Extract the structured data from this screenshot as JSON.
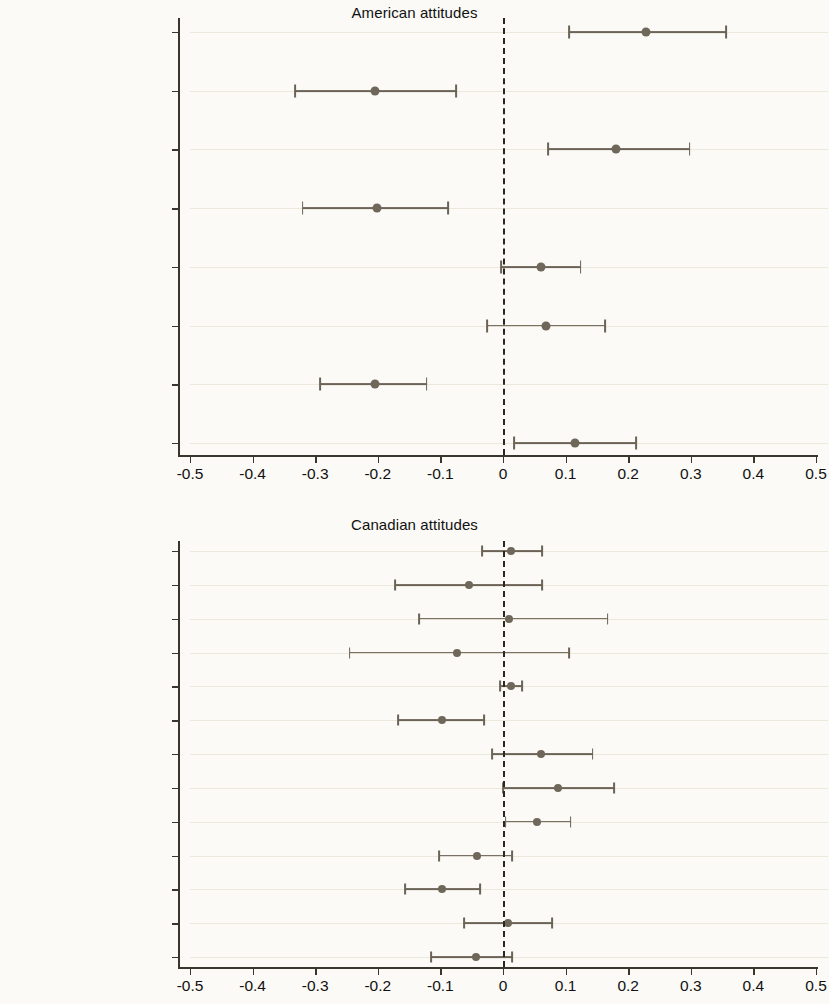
{
  "figure": {
    "axis_min": -0.5,
    "axis_max": 0.5,
    "tick_labels": [
      "-0.5",
      "-0.4",
      "-0.3",
      "-0.2",
      "-0.1",
      "0",
      "0.1",
      "0.2",
      "0.3",
      "0.4",
      "0.5"
    ],
    "tick_values": [
      -0.5,
      -0.4,
      -0.3,
      -0.2,
      -0.1,
      0,
      0.1,
      0.2,
      0.3,
      0.4,
      0.5
    ],
    "reference_value": 0,
    "point_color": "#6f6759",
    "line_color": "#6b6355",
    "grid_color": "#ece8dc",
    "background": "#fbfaf6"
  },
  "chart_data": [
    {
      "type": "scatter",
      "title": "American attitudes",
      "xlabel": "",
      "ylabel": "",
      "xlim": [
        -0.5,
        0.5
      ],
      "grid": true,
      "legend": "none",
      "reference_line": 0,
      "categories": [
        "Republican vote choice",
        "Democrat vote choice",
        "Republican ID",
        "Democrat ID",
        "Left right placement",
        "Clinton therm",
        "Obama therm",
        "Trump therm"
      ],
      "estimates": [
        0.228,
        -0.205,
        0.18,
        -0.202,
        0.06,
        0.068,
        -0.205,
        0.115
      ],
      "ci_low": [
        0.105,
        -0.332,
        0.072,
        -0.32,
        -0.003,
        -0.025,
        -0.292,
        0.018
      ],
      "ci_high": [
        0.357,
        -0.075,
        0.298,
        -0.088,
        0.124,
        0.163,
        -0.122,
        0.212
      ]
    },
    {
      "type": "scatter",
      "title": "Canadian attitudes",
      "xlabel": "",
      "ylabel": "",
      "xlim": [
        -0.5,
        0.5
      ],
      "grid": true,
      "legend": "none",
      "reference_line": 0,
      "categories": [
        "PPC vote choice",
        "NDP vote choice",
        "Conservative vote choice",
        "Liberal vote choice",
        "PPC ID",
        "NDP ID",
        "Conservative ID",
        "Liberal ID",
        "Left right placement",
        "Bernier therm",
        "Singh therm",
        "Scheer therm",
        "Trudeau therm"
      ],
      "estimates": [
        0.012,
        -0.055,
        0.01,
        -0.074,
        0.012,
        -0.098,
        0.06,
        0.088,
        0.055,
        -0.042,
        -0.097,
        0.008,
        -0.043
      ],
      "ci_low": [
        -0.034,
        -0.172,
        -0.134,
        -0.245,
        -0.004,
        -0.168,
        -0.018,
        0.0,
        0.004,
        -0.102,
        -0.156,
        -0.062,
        -0.115
      ],
      "ci_high": [
        0.062,
        0.062,
        0.167,
        0.105,
        0.03,
        -0.03,
        0.143,
        0.178,
        0.108,
        0.015,
        -0.037,
        0.078,
        0.014
      ]
    }
  ]
}
